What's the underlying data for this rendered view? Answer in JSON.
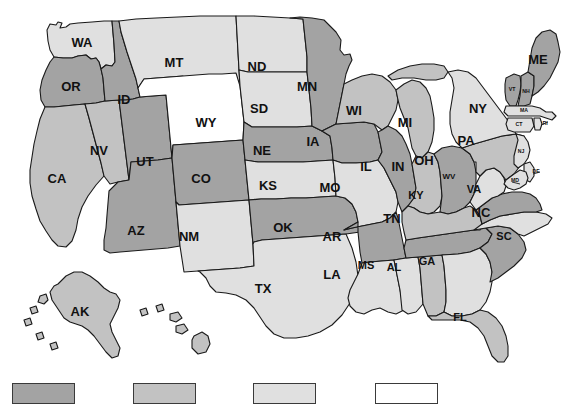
{
  "figure": {
    "type": "choropleth-map",
    "region": "United States",
    "background_color": "#ffffff",
    "border_color": "#1a1a1a"
  },
  "palette": {
    "level_1_dark": "#a3a3a3",
    "level_2_medium": "#c2c2c2",
    "level_3_light": "#e0e0e0",
    "level_4_white": "#ffffff"
  },
  "legend": {
    "orientation": "horizontal",
    "position": "bottom",
    "swatches": [
      {
        "name": "legend-swatch-1",
        "color": "#a3a3a3",
        "label": "",
        "x": 12
      },
      {
        "name": "legend-swatch-2",
        "color": "#c2c2c2",
        "label": "",
        "x": 133
      },
      {
        "name": "legend-swatch-3",
        "color": "#e0e0e0",
        "label": "",
        "x": 253
      },
      {
        "name": "legend-swatch-4",
        "color": "#ffffff",
        "label": "",
        "x": 375
      }
    ]
  },
  "chart_data": {
    "type": "map",
    "title": "",
    "xlabel": "",
    "ylabel": "",
    "legend_position": "bottom",
    "categories": [
      "AK",
      "AL",
      "AR",
      "AZ",
      "CA",
      "CO",
      "CT",
      "DE",
      "FL",
      "GA",
      "IA",
      "ID",
      "IL",
      "IN",
      "KS",
      "KY",
      "LA",
      "MA",
      "MD",
      "ME",
      "MI",
      "MN",
      "MO",
      "MS",
      "MT",
      "NC",
      "ND",
      "NE",
      "NH",
      "NJ",
      "NM",
      "NV",
      "NY",
      "OH",
      "OK",
      "OR",
      "PA",
      "RI",
      "SC",
      "SD",
      "TN",
      "TX",
      "UT",
      "VA",
      "VT",
      "WA",
      "WI",
      "WV",
      "WY"
    ],
    "values": [
      2,
      2,
      1,
      1,
      2,
      1,
      3,
      3,
      2,
      3,
      1,
      1,
      1,
      2,
      3,
      2,
      3,
      3,
      3,
      1,
      2,
      1,
      3,
      3,
      3,
      3,
      3,
      1,
      1,
      3,
      3,
      2,
      3,
      1,
      1,
      1,
      2,
      3,
      1,
      3,
      1,
      3,
      1,
      1,
      1,
      3,
      2,
      3,
      4
    ],
    "value_colors": {
      "1": "#a3a3a3",
      "2": "#c2c2c2",
      "3": "#e0e0e0",
      "4": "#ffffff"
    },
    "states": [
      {
        "code": "AK",
        "label": "AK",
        "shade": 2,
        "color": "#c2c2c2"
      },
      {
        "code": "AL",
        "label": "AL",
        "shade": 2,
        "color": "#c2c2c2"
      },
      {
        "code": "AR",
        "label": "AR",
        "shade": 1,
        "color": "#a3a3a3"
      },
      {
        "code": "AZ",
        "label": "AZ",
        "shade": 1,
        "color": "#a3a3a3"
      },
      {
        "code": "CA",
        "label": "CA",
        "shade": 2,
        "color": "#c2c2c2"
      },
      {
        "code": "CO",
        "label": "CO",
        "shade": 1,
        "color": "#a3a3a3"
      },
      {
        "code": "CT",
        "label": "CT",
        "shade": 3,
        "color": "#e0e0e0"
      },
      {
        "code": "DE",
        "label": "DE",
        "shade": 3,
        "color": "#e0e0e0"
      },
      {
        "code": "FL",
        "label": "FL",
        "shade": 2,
        "color": "#c2c2c2"
      },
      {
        "code": "GA",
        "label": "GA",
        "shade": 3,
        "color": "#e0e0e0"
      },
      {
        "code": "IA",
        "label": "IA",
        "shade": 1,
        "color": "#a3a3a3"
      },
      {
        "code": "ID",
        "label": "ID",
        "shade": 1,
        "color": "#a3a3a3"
      },
      {
        "code": "IL",
        "label": "IL",
        "shade": 1,
        "color": "#a3a3a3"
      },
      {
        "code": "IN",
        "label": "IN",
        "shade": 2,
        "color": "#c2c2c2"
      },
      {
        "code": "KS",
        "label": "KS",
        "shade": 3,
        "color": "#e0e0e0"
      },
      {
        "code": "KY",
        "label": "KY",
        "shade": 2,
        "color": "#c2c2c2"
      },
      {
        "code": "LA",
        "label": "LA",
        "shade": 3,
        "color": "#e0e0e0"
      },
      {
        "code": "MA",
        "label": "MA",
        "shade": 3,
        "color": "#e0e0e0"
      },
      {
        "code": "MD",
        "label": "MD",
        "shade": 3,
        "color": "#e0e0e0"
      },
      {
        "code": "ME",
        "label": "ME",
        "shade": 1,
        "color": "#a3a3a3"
      },
      {
        "code": "MI",
        "label": "MI",
        "shade": 2,
        "color": "#c2c2c2"
      },
      {
        "code": "MN",
        "label": "MN",
        "shade": 1,
        "color": "#a3a3a3"
      },
      {
        "code": "MO",
        "label": "MO",
        "shade": 3,
        "color": "#e0e0e0"
      },
      {
        "code": "MS",
        "label": "MS",
        "shade": 3,
        "color": "#e0e0e0"
      },
      {
        "code": "MT",
        "label": "MT",
        "shade": 3,
        "color": "#e0e0e0"
      },
      {
        "code": "NC",
        "label": "NC",
        "shade": 3,
        "color": "#e0e0e0"
      },
      {
        "code": "ND",
        "label": "ND",
        "shade": 3,
        "color": "#e0e0e0"
      },
      {
        "code": "NE",
        "label": "NE",
        "shade": 1,
        "color": "#a3a3a3"
      },
      {
        "code": "NH",
        "label": "NH",
        "shade": 1,
        "color": "#a3a3a3"
      },
      {
        "code": "NJ",
        "label": "NJ",
        "shade": 3,
        "color": "#e0e0e0"
      },
      {
        "code": "NM",
        "label": "NM",
        "shade": 3,
        "color": "#e0e0e0"
      },
      {
        "code": "NV",
        "label": "NV",
        "shade": 2,
        "color": "#c2c2c2"
      },
      {
        "code": "NY",
        "label": "NY",
        "shade": 3,
        "color": "#e0e0e0"
      },
      {
        "code": "OH",
        "label": "OH",
        "shade": 1,
        "color": "#a3a3a3"
      },
      {
        "code": "OK",
        "label": "OK",
        "shade": 1,
        "color": "#a3a3a3"
      },
      {
        "code": "OR",
        "label": "OR",
        "shade": 1,
        "color": "#a3a3a3"
      },
      {
        "code": "PA",
        "label": "PA",
        "shade": 2,
        "color": "#c2c2c2"
      },
      {
        "code": "RI",
        "label": "RI",
        "shade": 3,
        "color": "#e0e0e0"
      },
      {
        "code": "SC",
        "label": "SC",
        "shade": 1,
        "color": "#a3a3a3"
      },
      {
        "code": "SD",
        "label": "SD",
        "shade": 3,
        "color": "#e0e0e0"
      },
      {
        "code": "TN",
        "label": "TN",
        "shade": 1,
        "color": "#a3a3a3"
      },
      {
        "code": "TX",
        "label": "TX",
        "shade": 3,
        "color": "#e0e0e0"
      },
      {
        "code": "UT",
        "label": "UT",
        "shade": 1,
        "color": "#a3a3a3"
      },
      {
        "code": "VA",
        "label": "VA",
        "shade": 1,
        "color": "#a3a3a3"
      },
      {
        "code": "VT",
        "label": "VT",
        "shade": 1,
        "color": "#a3a3a3"
      },
      {
        "code": "WA",
        "label": "WA",
        "shade": 3,
        "color": "#e0e0e0"
      },
      {
        "code": "WI",
        "label": "WI",
        "shade": 2,
        "color": "#c2c2c2"
      },
      {
        "code": "WV",
        "label": "WV",
        "shade": 3,
        "color": "#e0e0e0"
      },
      {
        "code": "WY",
        "label": "WY",
        "shade": 4,
        "color": "#ffffff"
      }
    ]
  },
  "labels": {
    "WA": "WA",
    "OR": "OR",
    "CA": "CA",
    "NV": "NV",
    "ID": "ID",
    "MT": "MT",
    "WY": "WY",
    "UT": "UT",
    "AZ": "AZ",
    "CO": "CO",
    "NM": "NM",
    "ND": "ND",
    "SD": "SD",
    "NE": "NE",
    "KS": "KS",
    "OK": "OK",
    "TX": "TX",
    "MN": "MN",
    "IA": "IA",
    "MO": "MO",
    "AR": "AR",
    "LA": "LA",
    "WI": "WI",
    "IL": "IL",
    "MI": "MI",
    "IN": "IN",
    "OH": "OH",
    "KY": "KY",
    "TN": "TN",
    "MS": "MS",
    "AL": "AL",
    "GA": "GA",
    "FL": "FL",
    "SC": "SC",
    "NC": "NC",
    "VA": "VA",
    "WV": "WV",
    "PA": "PA",
    "NY": "NY",
    "ME": "ME",
    "VT": "VT",
    "NH": "NH",
    "MA": "MA",
    "CT": "CT",
    "RI": "RI",
    "NJ": "NJ",
    "DE": "DE",
    "MD": "MD",
    "AK": "AK",
    "HI": "HI"
  }
}
